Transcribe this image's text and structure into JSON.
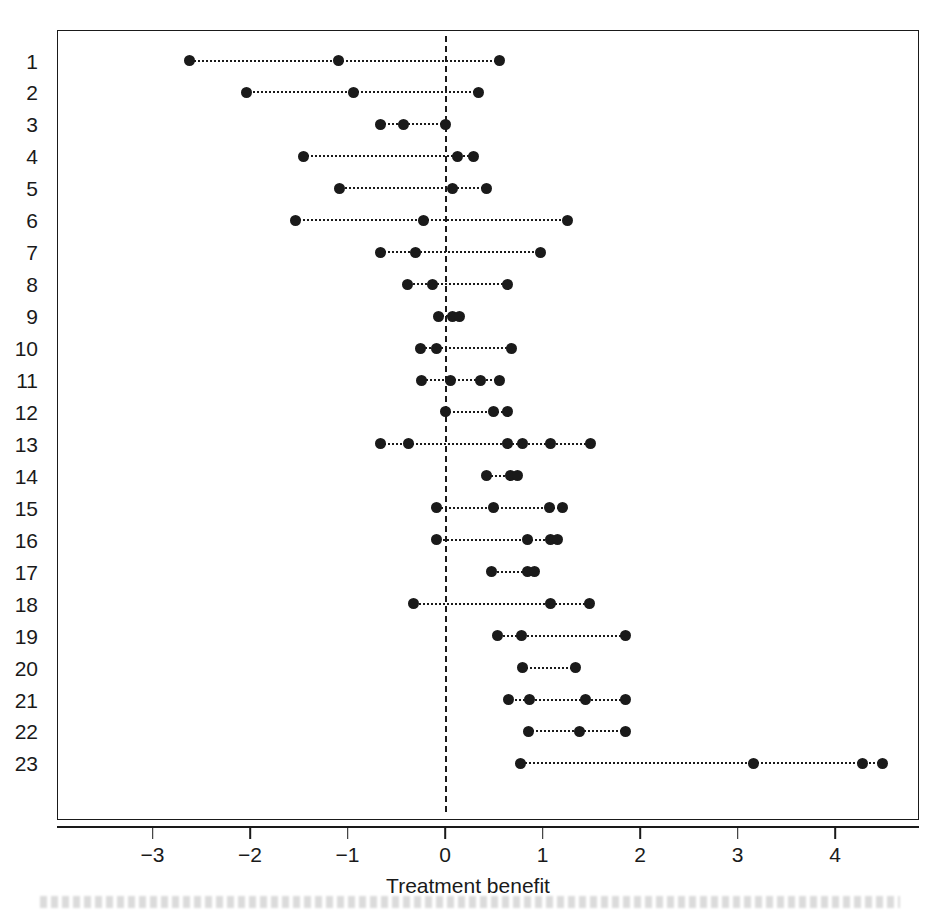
{
  "figure": {
    "title": "",
    "xaxis_title": "Treatment benefit",
    "caption": ""
  },
  "chart_data": {
    "type": "scatter",
    "title": "",
    "xlabel": "Treatment benefit",
    "ylabel": "",
    "xlim": [
      -3.85,
      4.65
    ],
    "ylim": [
      0.5,
      23.5
    ],
    "grid": false,
    "legend": null,
    "reference_line": {
      "x": 0,
      "style": "dashed"
    },
    "xticks": [
      -3,
      -2,
      -1,
      0,
      1,
      2,
      3,
      4
    ],
    "xticklabels": [
      "−3",
      "−2",
      "−1",
      "0",
      "1",
      "2",
      "3",
      "4"
    ],
    "yticks": [
      1,
      2,
      3,
      4,
      5,
      6,
      7,
      8,
      9,
      10,
      11,
      12,
      13,
      14,
      15,
      16,
      17,
      18,
      19,
      20,
      21,
      22,
      23
    ],
    "yticklabels": [
      "1",
      "2",
      "3",
      "4",
      "5",
      "6",
      "7",
      "8",
      "9",
      "10",
      "11",
      "12",
      "13",
      "14",
      "15",
      "16",
      "17",
      "18",
      "19",
      "20",
      "21",
      "22",
      "23"
    ],
    "series_description": "Per-study dotted interval with marker points (treatment benefit)",
    "rows": [
      {
        "label": "1",
        "points": [
          -2.62,
          -1.09,
          0.56
        ]
      },
      {
        "label": "2",
        "points": [
          -2.04,
          -0.94,
          0.34
        ]
      },
      {
        "label": "3",
        "points": [
          -0.66,
          -0.43,
          0.0
        ]
      },
      {
        "label": "4",
        "points": [
          -1.45,
          0.13,
          0.29
        ]
      },
      {
        "label": "5",
        "points": [
          -1.08,
          0.08,
          0.43
        ]
      },
      {
        "label": "6",
        "points": [
          -1.53,
          -0.22,
          1.26
        ]
      },
      {
        "label": "7",
        "points": [
          -0.66,
          -0.3,
          0.98
        ]
      },
      {
        "label": "8",
        "points": [
          -0.38,
          -0.13,
          0.64
        ]
      },
      {
        "label": "9",
        "points": [
          -0.07,
          0.08,
          0.15
        ]
      },
      {
        "label": "10",
        "points": [
          -0.25,
          -0.09,
          0.68
        ]
      },
      {
        "label": "11",
        "points": [
          -0.24,
          0.06,
          0.36,
          0.56
        ]
      },
      {
        "label": "12",
        "points": [
          0.0,
          0.5,
          0.64
        ]
      },
      {
        "label": "13",
        "points": [
          -0.66,
          -0.37,
          0.64,
          0.79,
          1.08,
          1.49
        ]
      },
      {
        "label": "14",
        "points": [
          0.43,
          0.67,
          0.74
        ]
      },
      {
        "label": "15",
        "points": [
          -0.09,
          0.5,
          1.07,
          1.21
        ]
      },
      {
        "label": "16",
        "points": [
          -0.09,
          0.85,
          1.08,
          1.15
        ]
      },
      {
        "label": "17",
        "points": [
          0.48,
          0.85,
          0.92
        ]
      },
      {
        "label": "18",
        "points": [
          -0.32,
          1.08,
          1.48
        ]
      },
      {
        "label": "19",
        "points": [
          0.54,
          0.78,
          1.85
        ]
      },
      {
        "label": "20",
        "points": [
          0.79,
          1.34
        ]
      },
      {
        "label": "21",
        "points": [
          0.65,
          0.87,
          1.44,
          1.85
        ]
      },
      {
        "label": "22",
        "points": [
          0.86,
          1.38,
          1.85
        ]
      },
      {
        "label": "23",
        "points": [
          0.77,
          3.16,
          4.28,
          4.49
        ]
      }
    ]
  },
  "colors": {
    "ink": "#1a1a1a",
    "background": "#ffffff"
  }
}
